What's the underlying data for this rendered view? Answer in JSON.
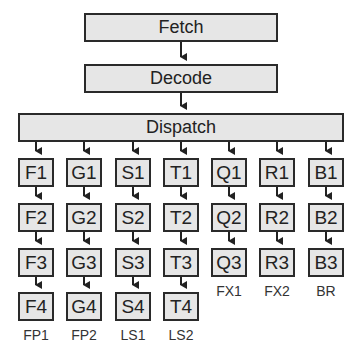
{
  "stages": {
    "fetch": "Fetch",
    "decode": "Decode",
    "dispatch": "Dispatch"
  },
  "columns": [
    {
      "label": "FP1",
      "units": [
        "F1",
        "F2",
        "F3",
        "F4"
      ]
    },
    {
      "label": "FP2",
      "units": [
        "G1",
        "G2",
        "G3",
        "G4"
      ]
    },
    {
      "label": "LS1",
      "units": [
        "S1",
        "S2",
        "S3",
        "S4"
      ]
    },
    {
      "label": "LS2",
      "units": [
        "T1",
        "T2",
        "T3",
        "T4"
      ]
    },
    {
      "label": "FX1",
      "units": [
        "Q1",
        "Q2",
        "Q3"
      ]
    },
    {
      "label": "FX2",
      "units": [
        "R1",
        "R2",
        "R3"
      ]
    },
    {
      "label": "BR",
      "units": [
        "B1",
        "B2",
        "B3"
      ]
    }
  ],
  "colors": {
    "box_fill": "#e6e6e6",
    "box_border": "#2a2a2a",
    "arrow": "#222222"
  }
}
